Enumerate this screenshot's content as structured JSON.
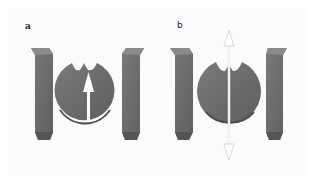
{
  "figure": {
    "panels": [
      {
        "label": "a",
        "description": "Disc with two notches between two pillars; single upward arrow inside disc",
        "arrow": "single-headed-up"
      },
      {
        "label": "b",
        "description": "Disc with two notches between two pillars; double-headed vertical arrow through disc",
        "arrow": "double-headed-vertical"
      }
    ],
    "colors": {
      "shape_fill": "#6e6e6e",
      "shape_shadow": "#4a4a4a",
      "shape_highlight": "#8c8c8c",
      "arrow_fill": "#ffffff",
      "arrow_outline_b": "#d8d8d8",
      "background": "#fbfbfb"
    }
  }
}
